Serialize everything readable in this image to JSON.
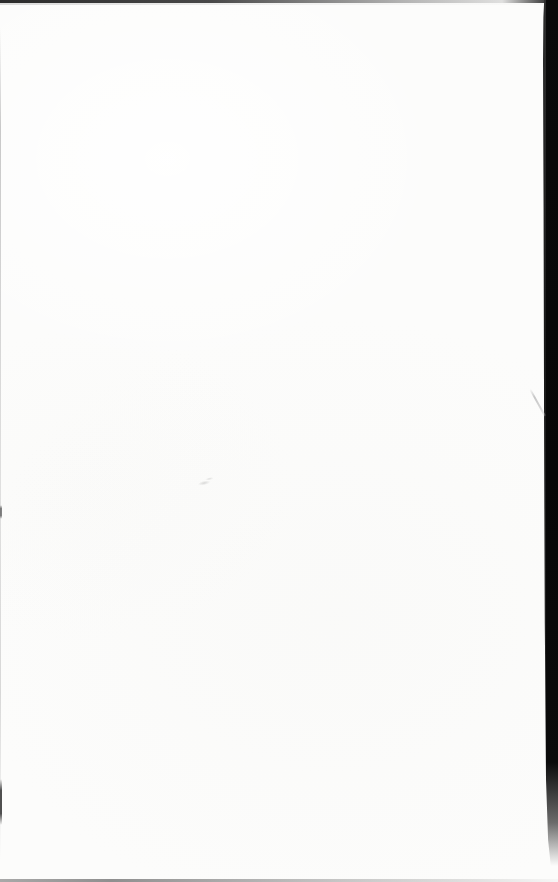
{
  "document": {
    "description": "Blank scanned book page; no printed text, dark scanner background visible along the top and right edges",
    "visible_text": ""
  },
  "colors": {
    "paper": "#fcfcfb",
    "scan_background": "#0a0a0a",
    "top_edge": "#2b2b2b",
    "bottom_edge": "#8f8f8f",
    "left_edge": "#c9c9c9",
    "edge_notch": "#4f4f4f",
    "hair_mark": "#c6c6c6",
    "smudge": "#bdbdbd"
  }
}
